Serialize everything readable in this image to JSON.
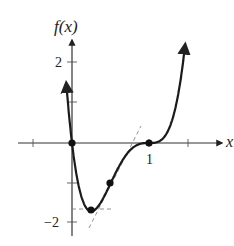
{
  "chart_data": {
    "type": "line",
    "title": "",
    "ylabel": "f(x)",
    "xlabel": "x",
    "function": "f(x) = 16x(x-1)^3",
    "xlim": [
      -0.9,
      2.0
    ],
    "ylim": [
      -2.3,
      2.6
    ],
    "x_ticks": [
      -0.5,
      1,
      1.5
    ],
    "x_tick_labels": [
      {
        "value": 1,
        "label": "1"
      }
    ],
    "y_ticks": [
      -2,
      -1,
      1,
      2
    ],
    "y_tick_labels": [
      {
        "value": 2,
        "label": "2"
      },
      {
        "value": -2,
        "label": "−2"
      }
    ],
    "series": [
      {
        "name": "f(x)",
        "x": [
          -0.07,
          0,
          0.1,
          0.2,
          0.25,
          0.3,
          0.4,
          0.5,
          0.6,
          0.7,
          0.8,
          0.9,
          1.0,
          1.1,
          1.2,
          1.3,
          1.4,
          1.5
        ],
        "y": [
          2.0,
          0,
          -1.17,
          -1.64,
          -1.69,
          -1.65,
          -1.38,
          -1.0,
          -0.61,
          -0.3,
          -0.1,
          -0.01,
          0,
          0.02,
          0.15,
          0.56,
          1.43,
          3.0
        ]
      }
    ],
    "points": [
      {
        "x": 0,
        "y": 0,
        "label": "zero"
      },
      {
        "x": 0.25,
        "y": -1.69,
        "label": "minimum"
      },
      {
        "x": 0.5,
        "y": -1.0,
        "label": "inflection"
      },
      {
        "x": 1,
        "y": 0,
        "label": "triple root / inflection"
      }
    ],
    "dashed_lines": [
      {
        "description": "horizontal tangent at minimum",
        "y": -1.69,
        "x_from": 0.0,
        "x_to": 0.5
      },
      {
        "description": "tangent line at inflection point x=0.5, slope 4",
        "x_from": 0.22,
        "x_to": 0.92
      }
    ],
    "grid": false,
    "legend": null
  },
  "labels": {
    "y_axis": "f(x)",
    "x_axis": "x",
    "tick_x_1": "1",
    "tick_y_2": "2",
    "tick_y_neg2": "−2"
  }
}
